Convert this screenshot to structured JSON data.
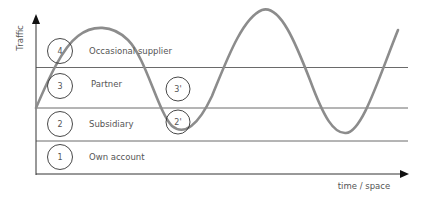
{
  "diagram": {
    "y_axis_label": "Traffic",
    "x_axis_label": "time / space",
    "levels": [
      {
        "number": "4",
        "label": "Occasional supplier"
      },
      {
        "number": "3",
        "label": "Partner"
      },
      {
        "number": "2",
        "label": "Subsidiary"
      },
      {
        "number": "1",
        "label": "Own account"
      }
    ],
    "markers": [
      {
        "number": "3'"
      },
      {
        "number": "2'"
      }
    ],
    "curve": {
      "type": "sine-wave",
      "color": "#8c8c8c"
    },
    "colors": {
      "lines": "#444444",
      "text": "#555555",
      "curve": "#8c8c8c"
    }
  }
}
